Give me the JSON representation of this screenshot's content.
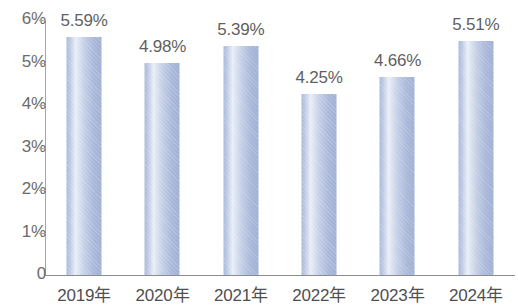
{
  "chart_data": {
    "type": "bar",
    "title": "",
    "subtitle": "",
    "xlabel": "",
    "ylabel": "",
    "categories": [
      "2019年",
      "2020年",
      "2021年",
      "2022年",
      "2023年",
      "2024年"
    ],
    "values": [
      5.59,
      4.98,
      5.39,
      4.25,
      4.66,
      5.51
    ],
    "value_labels": [
      "5.59%",
      "4.98%",
      "5.39%",
      "4.25%",
      "4.66%",
      "5.51%"
    ],
    "ylim": [
      0,
      6
    ],
    "ytick_values": [
      0,
      1,
      2,
      3,
      4,
      5,
      6
    ],
    "ytick_labels": [
      "0",
      "1%",
      "2%",
      "3%",
      "4%",
      "5%",
      "6%"
    ],
    "grid": false,
    "legend": null,
    "series": [
      {
        "name": "",
        "values": [
          5.59,
          4.98,
          5.39,
          4.25,
          4.66,
          5.51
        ]
      }
    ],
    "colors": {
      "bar_left": "#aab9da",
      "bar_highlight": "#e9eef7",
      "bar_right": "#9fb0d6",
      "axis": "#a6a6a6",
      "baseline": "#8c8c8c",
      "value_label": "#5f5f5f",
      "tick_label": "#6b6b6b",
      "category_label": "#4f4f4f",
      "background": "#ffffff"
    }
  }
}
